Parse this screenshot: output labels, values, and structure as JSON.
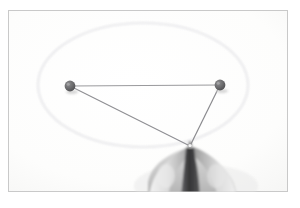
{
  "scene": {
    "title": "Ellipse construction with two pins and a taut string",
    "caption": "A hand holds a pencil taut against a loop of string pinned at two foci, tracing an ellipse on paper.",
    "medium": "photograph",
    "palette": {
      "page_background": "#ffffff",
      "paper_background": "#fcfcfb",
      "frame_border": "#c9c9c9",
      "ellipse_stroke": "#e2e2e4",
      "string_stroke": "#8d8d90",
      "pin_fill": "#6a6a6a",
      "pin_shadow": "#bdbdbd",
      "pencil_dark": "#3a3a3c",
      "skin_light": "#ededed",
      "skin_mid": "#cfcfcf",
      "skin_shadow": "#9a9a9a"
    },
    "frame": {
      "label": "photo border",
      "x": 8,
      "y": 10,
      "width": 280,
      "height": 182
    },
    "ellipse": {
      "label": "traced ellipse",
      "center_x": 143,
      "center_y": 85,
      "radius_x": 105,
      "radius_y": 62,
      "stroke_width": 1
    },
    "pins": [
      {
        "label": "left pin (focus 1)",
        "name": "pin-left",
        "cx": 70,
        "cy": 86,
        "r": 5.5
      },
      {
        "label": "right pin (focus 2)",
        "name": "pin-right",
        "cx": 220,
        "cy": 85,
        "r": 5.5
      }
    ],
    "pencil_point": {
      "label": "pencil tip",
      "x": 190,
      "y": 146
    },
    "string_segments": [
      {
        "label": "string: left pin to right pin",
        "x1": 70,
        "y1": 86,
        "x2": 220,
        "y2": 85
      },
      {
        "label": "string: left pin to pencil tip",
        "x1": 70,
        "y1": 86,
        "x2": 190,
        "y2": 146
      },
      {
        "label": "string: right pin to pencil tip",
        "x1": 220,
        "y1": 85,
        "x2": 190,
        "y2": 146
      }
    ],
    "hand": {
      "label": "hand holding pencil",
      "description": "thumb and index finger pinching a pencil, entering from bottom right"
    }
  }
}
